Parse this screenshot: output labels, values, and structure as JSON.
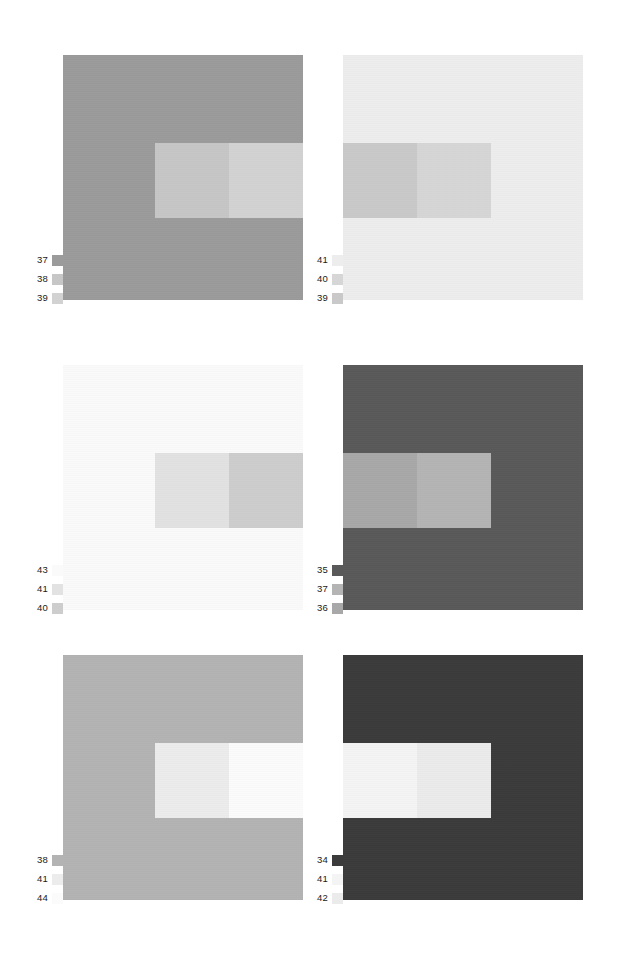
{
  "figure": {
    "background_color": "#ffffff",
    "panel_count": 6,
    "layout": "2 columns x 3 rows"
  },
  "panels": [
    {
      "id": "panel-top-left",
      "position": "row 1, column 1",
      "background_color": "#9b9b9b",
      "inner_rect": {
        "left_pct": 38.5,
        "top_pct": 36.0,
        "width_pct": 61.5,
        "height_pct": 30.5,
        "left_half_color": "#c6c6c6",
        "right_half_color": "#d2d2d2"
      },
      "legend": [
        {
          "label": "37",
          "color": "#9b9b9b"
        },
        {
          "label": "38",
          "color": "#c6c6c6"
        },
        {
          "label": "39",
          "color": "#d2d2d2"
        }
      ]
    },
    {
      "id": "panel-top-right",
      "position": "row 1, column 2",
      "background_color": "#ededed",
      "inner_rect": {
        "left_pct": 0.0,
        "top_pct": 36.0,
        "width_pct": 61.5,
        "height_pct": 30.5,
        "left_half_color": "#c9c9c9",
        "right_half_color": "#d6d6d6"
      },
      "legend": [
        {
          "label": "41",
          "color": "#ededed"
        },
        {
          "label": "40",
          "color": "#d6d6d6"
        },
        {
          "label": "39",
          "color": "#c9c9c9"
        }
      ]
    },
    {
      "id": "panel-middle-left",
      "position": "row 2, column 1",
      "background_color": "#fafafa",
      "inner_rect": {
        "left_pct": 38.5,
        "top_pct": 36.0,
        "width_pct": 61.5,
        "height_pct": 30.5,
        "left_half_color": "#e2e2e2",
        "right_half_color": "#cdcdcd"
      },
      "legend": [
        {
          "label": "43",
          "color": "#fafafa"
        },
        {
          "label": "41",
          "color": "#e2e2e2"
        },
        {
          "label": "40",
          "color": "#cdcdcd"
        }
      ]
    },
    {
      "id": "panel-middle-right",
      "position": "row 2, column 2",
      "background_color": "#595959",
      "inner_rect": {
        "left_pct": 0.0,
        "top_pct": 36.0,
        "width_pct": 61.5,
        "height_pct": 30.5,
        "left_half_color": "#a8a8a8",
        "right_half_color": "#b4b4b4"
      },
      "legend": [
        {
          "label": "35",
          "color": "#595959"
        },
        {
          "label": "37",
          "color": "#b4b4b4"
        },
        {
          "label": "36",
          "color": "#a8a8a8"
        }
      ]
    },
    {
      "id": "panel-bottom-left",
      "position": "row 3, column 1",
      "background_color": "#b3b3b3",
      "inner_rect": {
        "left_pct": 38.5,
        "top_pct": 36.0,
        "width_pct": 61.5,
        "height_pct": 30.5,
        "left_half_color": "#ececec",
        "right_half_color": "#fbfbfb"
      },
      "legend": [
        {
          "label": "38",
          "color": "#b3b3b3"
        },
        {
          "label": "41",
          "color": "#ececec"
        },
        {
          "label": "44",
          "color": "#fbfbfb"
        }
      ]
    },
    {
      "id": "panel-bottom-right",
      "position": "row 3, column 2",
      "background_color": "#3b3b3b",
      "inner_rect": {
        "left_pct": 0.0,
        "top_pct": 36.0,
        "width_pct": 61.5,
        "height_pct": 30.5,
        "left_half_color": "#f4f4f4",
        "right_half_color": "#ebebeb"
      },
      "legend": [
        {
          "label": "34",
          "color": "#3b3b3b"
        },
        {
          "label": "41",
          "color": "#f4f4f4"
        },
        {
          "label": "42",
          "color": "#ebebeb"
        }
      ]
    }
  ]
}
